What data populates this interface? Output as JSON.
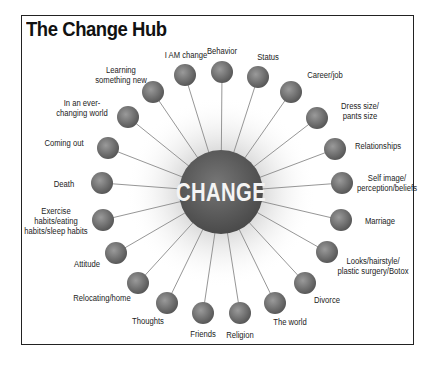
{
  "title": "The Change Hub",
  "center": {
    "label": "CHANGE",
    "x": 221,
    "y": 192,
    "r": 42,
    "color": "#5e5e5e"
  },
  "node_style": {
    "r": 11,
    "fill_light": "#9a9a9a",
    "fill_dark": "#555555",
    "spoke_color": "#8a8a8a"
  },
  "nodes": [
    {
      "label": "I AM change",
      "x": 185,
      "y": 75,
      "lx": 186,
      "ly": 55
    },
    {
      "label": "Behavior",
      "x": 222,
      "y": 72,
      "lx": 222,
      "ly": 51
    },
    {
      "label": "Status",
      "x": 258,
      "y": 77,
      "lx": 268,
      "ly": 57
    },
    {
      "label": "Career/job",
      "x": 291,
      "y": 92,
      "lx": 325,
      "ly": 75
    },
    {
      "label": "Dress size/\npants size",
      "x": 317,
      "y": 118,
      "lx": 360,
      "ly": 111
    },
    {
      "label": "Relationships",
      "x": 335,
      "y": 149,
      "lx": 378,
      "ly": 146
    },
    {
      "label": "Self image/\nperception/beliefs",
      "x": 342,
      "y": 183,
      "lx": 387,
      "ly": 183
    },
    {
      "label": "Marriage",
      "x": 341,
      "y": 220,
      "lx": 380,
      "ly": 221
    },
    {
      "label": "Looks/hairstyle/\nplastic surgery/Botox",
      "x": 327,
      "y": 252,
      "lx": 373,
      "ly": 266
    },
    {
      "label": "Divorce",
      "x": 305,
      "y": 283,
      "lx": 327,
      "ly": 300
    },
    {
      "label": "The world",
      "x": 275,
      "y": 303,
      "lx": 290,
      "ly": 322
    },
    {
      "label": "Religion",
      "x": 240,
      "y": 313,
      "lx": 240,
      "ly": 335
    },
    {
      "label": "Friends",
      "x": 203,
      "y": 313,
      "lx": 203,
      "ly": 334
    },
    {
      "label": "Thoughts",
      "x": 167,
      "y": 303,
      "lx": 148,
      "ly": 321
    },
    {
      "label": "Relocating/home",
      "x": 138,
      "y": 283,
      "lx": 102,
      "ly": 298
    },
    {
      "label": "Attitude",
      "x": 116,
      "y": 253,
      "lx": 87,
      "ly": 264
    },
    {
      "label": "Exercise\nhabits/eating\nhabits/sleep habits",
      "x": 103,
      "y": 220,
      "lx": 56,
      "ly": 221
    },
    {
      "label": "Death",
      "x": 102,
      "y": 183,
      "lx": 64,
      "ly": 184
    },
    {
      "label": "Coming out",
      "x": 108,
      "y": 148,
      "lx": 64,
      "ly": 143
    },
    {
      "label": "In an ever-\nchanging world",
      "x": 128,
      "y": 117,
      "lx": 82,
      "ly": 108
    },
    {
      "label": "Learning\nsomething new",
      "x": 153,
      "y": 92,
      "lx": 121,
      "ly": 75
    }
  ]
}
